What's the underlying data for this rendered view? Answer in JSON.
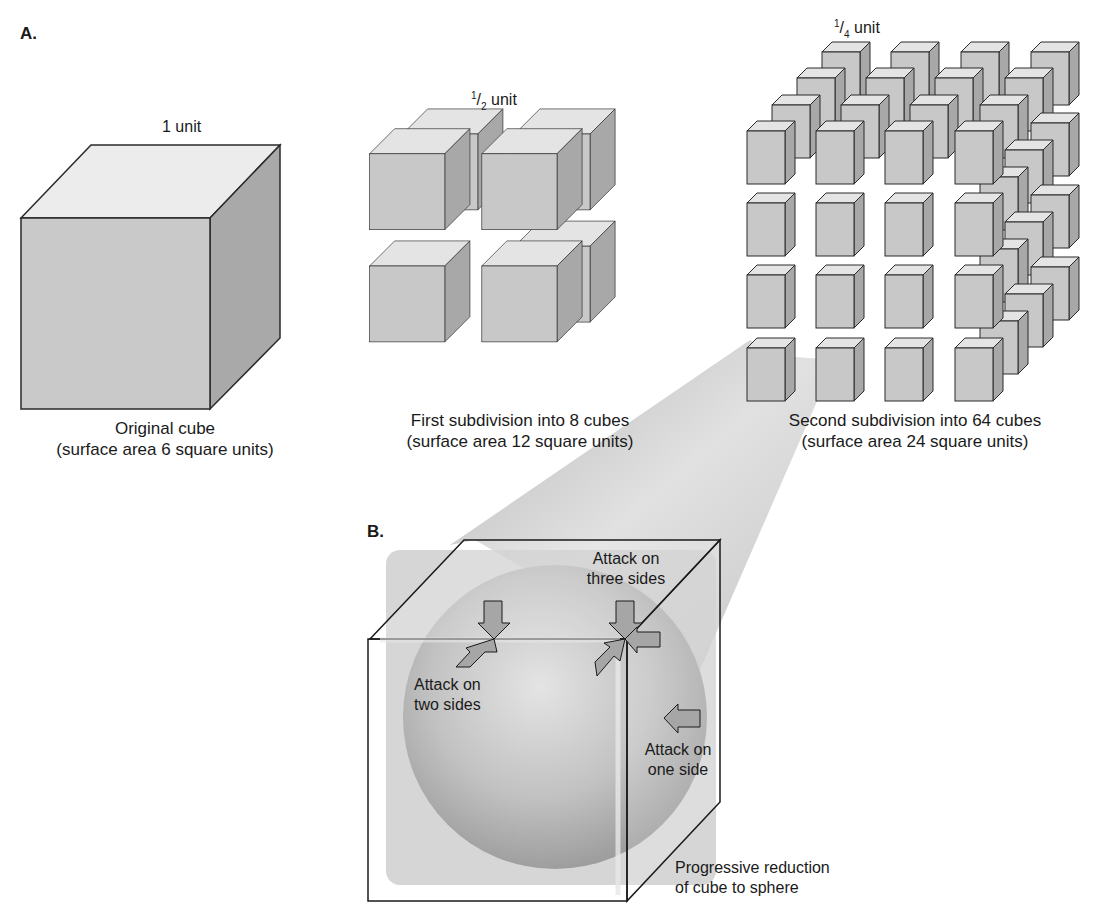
{
  "panel_a": {
    "label": "A.",
    "original": {
      "unit_label": "1 unit",
      "caption_line1": "Original cube",
      "caption_line2": "(surface area 6 square units)",
      "cube_count": 1,
      "surface_area": 6
    },
    "first_subdivision": {
      "unit_num": "1",
      "unit_den": "2",
      "unit_suffix": " unit",
      "caption_line1": "First subdivision into 8 cubes",
      "caption_line2": "(surface area 12 square units)",
      "cube_count": 8,
      "surface_area": 12
    },
    "second_subdivision": {
      "unit_num": "1",
      "unit_den": "4",
      "unit_suffix": " unit",
      "caption_line1": "Second subdivision into 64 cubes",
      "caption_line2": "(surface area 24 square units)",
      "cube_count": 64,
      "surface_area": 24
    }
  },
  "panel_b": {
    "label": "B.",
    "callouts": {
      "three_sides_line1": "Attack on",
      "three_sides_line2": "three sides",
      "two_sides_line1": "Attack on",
      "two_sides_line2": "two sides",
      "one_side_line1": "Attack on",
      "one_side_line2": "one side"
    },
    "caption_line1": "Progressive reduction",
    "caption_line2": "of cube to sphere"
  },
  "colors": {
    "cube_front": "#c9c9c9",
    "cube_top": "#e6e6e6",
    "cube_side": "#a8a8a8",
    "outline": "#2a2a2a",
    "sphere": "#b4b4b4",
    "cone": "#bdbdbd",
    "arrow_fill": "#a6a6a6"
  }
}
